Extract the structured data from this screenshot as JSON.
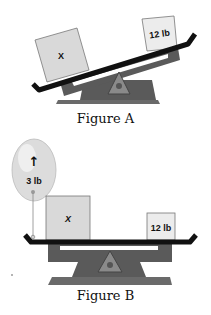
{
  "figure_a": {
    "caption": "Figure A",
    "left_box_label": "X",
    "right_box_label": "12 lb"
  },
  "figure_b": {
    "caption": "Figure B",
    "balloon_arrow": "↑",
    "balloon_label": "3 lb",
    "left_box_label": "X",
    "right_box_label": "12 lb"
  },
  "colors": {
    "beam": "#111111",
    "scale_body": "#5a5a5a",
    "pivot": "#8a8a8a",
    "box_fill": "#d9d9d9",
    "right_box_fill": "#ececec",
    "balloon": "#dcdcdc"
  }
}
